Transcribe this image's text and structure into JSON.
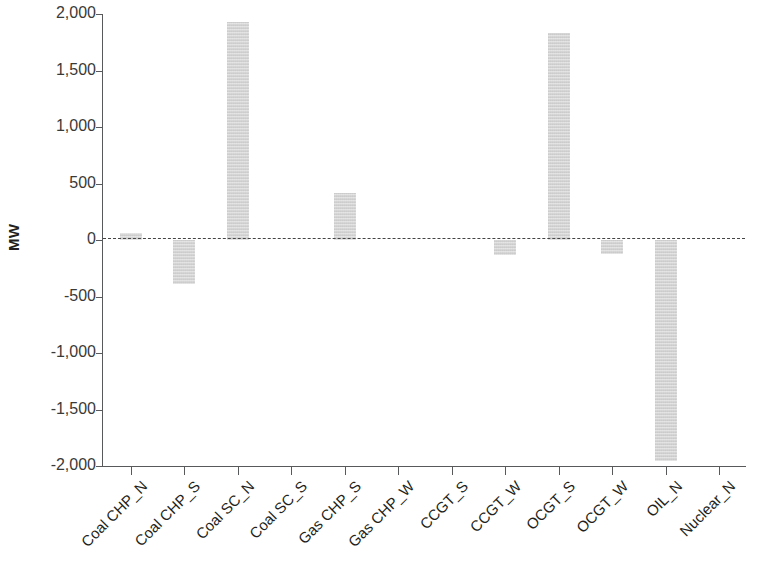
{
  "chart_data": {
    "type": "bar",
    "title": "",
    "xlabel": "",
    "ylabel": "MW",
    "ylim": [
      -2000,
      2000
    ],
    "yticks": [
      2000,
      1500,
      1000,
      500,
      0,
      -500,
      -1000,
      -1500,
      -2000
    ],
    "ytick_labels": [
      "2,000",
      "1,500",
      "1,000",
      "500",
      "0",
      "-500",
      "-1,000",
      "-1,500",
      "-2,000"
    ],
    "grid": false,
    "legend": null,
    "zero_reference_line": true,
    "bar_color": "#d4d4d4",
    "axis_color": "#58595b",
    "categories": [
      "Coal CHP_N",
      "Coal CHP_S",
      "Coal SC_N",
      "Coal SC_S",
      "Gas CHP_S",
      "Gas CHP_W",
      "CCGT_S",
      "CCGT_W",
      "OCGT_S",
      "OCGT_W",
      "OIL_N",
      "Nuclear_N"
    ],
    "values": [
      60,
      -390,
      1925,
      0,
      420,
      0,
      0,
      -130,
      1830,
      -125,
      -1960,
      0
    ]
  }
}
